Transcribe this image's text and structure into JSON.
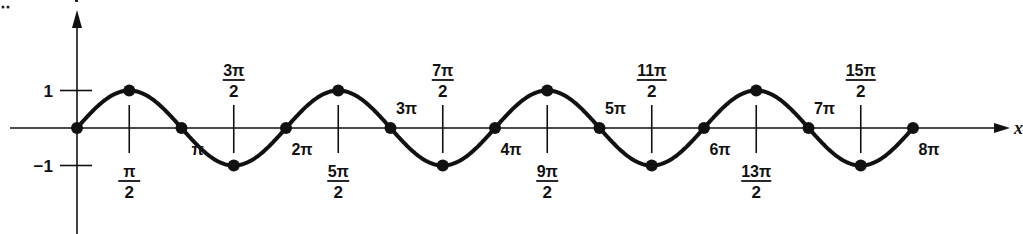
{
  "chart_data": {
    "type": "line",
    "title": "",
    "function": "y = sin x",
    "xlabel": "x",
    "ylabel": "y",
    "x_range_radians": [
      0,
      25.1327
    ],
    "xlim_label": [
      "0",
      "8π"
    ],
    "ylim": [
      -1,
      1
    ],
    "grid": false,
    "legend": null,
    "y_ticks": [
      {
        "value": 1,
        "label": "1"
      },
      {
        "value": -1,
        "label": "−1"
      }
    ],
    "x_tick_labels": [
      {
        "mult_half_pi": 1,
        "num": "π",
        "den": "2",
        "pos": "below"
      },
      {
        "mult_half_pi": 2,
        "text": "π",
        "pos": "below"
      },
      {
        "mult_half_pi": 3,
        "num": "3π",
        "den": "2",
        "pos": "above"
      },
      {
        "mult_half_pi": 4,
        "text": "2π",
        "pos": "below"
      },
      {
        "mult_half_pi": 5,
        "num": "5π",
        "den": "2",
        "pos": "below"
      },
      {
        "mult_half_pi": 6,
        "text": "3π",
        "pos": "above"
      },
      {
        "mult_half_pi": 7,
        "num": "7π",
        "den": "2",
        "pos": "above"
      },
      {
        "mult_half_pi": 8,
        "text": "4π",
        "pos": "below"
      },
      {
        "mult_half_pi": 9,
        "num": "9π",
        "den": "2",
        "pos": "below"
      },
      {
        "mult_half_pi": 10,
        "text": "5π",
        "pos": "above"
      },
      {
        "mult_half_pi": 11,
        "num": "11π",
        "den": "2",
        "pos": "above"
      },
      {
        "mult_half_pi": 12,
        "text": "6π",
        "pos": "below"
      },
      {
        "mult_half_pi": 13,
        "num": "13π",
        "den": "2",
        "pos": "below"
      },
      {
        "mult_half_pi": 14,
        "text": "7π",
        "pos": "above"
      },
      {
        "mult_half_pi": 15,
        "num": "15π",
        "den": "2",
        "pos": "above"
      },
      {
        "mult_half_pi": 16,
        "text": "8π",
        "pos": "below"
      }
    ],
    "points": [
      {
        "x": "0",
        "y": 0
      },
      {
        "x": "π/2",
        "y": 1
      },
      {
        "x": "π",
        "y": 0
      },
      {
        "x": "3π/2",
        "y": -1
      },
      {
        "x": "2π",
        "y": 0
      },
      {
        "x": "5π/2",
        "y": 1
      },
      {
        "x": "3π",
        "y": 0
      },
      {
        "x": "7π/2",
        "y": -1
      },
      {
        "x": "4π",
        "y": 0
      },
      {
        "x": "9π/2",
        "y": 1
      },
      {
        "x": "5π",
        "y": 0
      },
      {
        "x": "11π/2",
        "y": -1
      },
      {
        "x": "6π",
        "y": 0
      },
      {
        "x": "13π/2",
        "y": 1
      },
      {
        "x": "7π",
        "y": 0
      },
      {
        "x": "15π/2",
        "y": -1
      },
      {
        "x": "8π",
        "y": 0
      }
    ]
  },
  "layout": {
    "origin_px": [
      77,
      128
    ],
    "half_pi_px": 52.25,
    "amplitude_px": 37.5,
    "x_axis_start": 10,
    "x_axis_end": 1010,
    "y_axis_top": 10,
    "y_axis_bottom": 234
  },
  "colors": {
    "ink": "#111111",
    "background": "#ffffff"
  }
}
